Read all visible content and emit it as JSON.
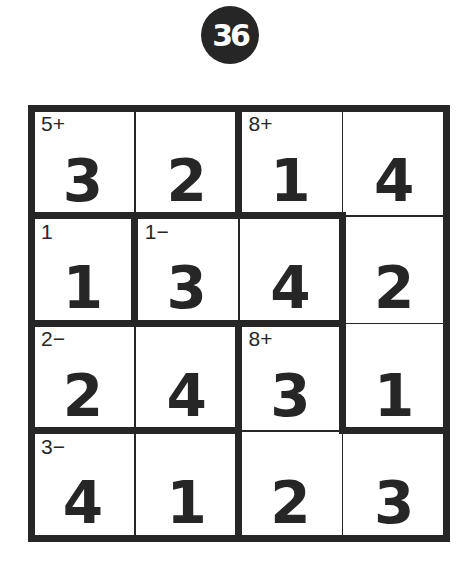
{
  "puzzle": {
    "number": "36",
    "size": 4,
    "colors": {
      "ink": "#262626",
      "background": "#ffffff"
    },
    "cells": [
      [
        {
          "value": "3",
          "clue": "5+"
        },
        {
          "value": "2",
          "clue": ""
        },
        {
          "value": "1",
          "clue": "8+"
        },
        {
          "value": "4",
          "clue": ""
        }
      ],
      [
        {
          "value": "1",
          "clue": "1"
        },
        {
          "value": "3",
          "clue": "1−"
        },
        {
          "value": "4",
          "clue": ""
        },
        {
          "value": "2",
          "clue": ""
        }
      ],
      [
        {
          "value": "2",
          "clue": "2−"
        },
        {
          "value": "4",
          "clue": ""
        },
        {
          "value": "3",
          "clue": "8+"
        },
        {
          "value": "1",
          "clue": ""
        }
      ],
      [
        {
          "value": "4",
          "clue": "3−"
        },
        {
          "value": "1",
          "clue": ""
        },
        {
          "value": "2",
          "clue": ""
        },
        {
          "value": "3",
          "clue": ""
        }
      ]
    ],
    "cages": [
      {
        "clue": "5+",
        "cells": [
          [
            0,
            0
          ],
          [
            0,
            1
          ]
        ]
      },
      {
        "clue": "8+",
        "cells": [
          [
            0,
            2
          ],
          [
            0,
            3
          ],
          [
            1,
            3
          ],
          [
            2,
            3
          ]
        ]
      },
      {
        "clue": "1",
        "cells": [
          [
            1,
            0
          ]
        ]
      },
      {
        "clue": "1−",
        "cells": [
          [
            1,
            1
          ],
          [
            1,
            2
          ]
        ]
      },
      {
        "clue": "2−",
        "cells": [
          [
            2,
            0
          ],
          [
            2,
            1
          ]
        ]
      },
      {
        "clue": "8+",
        "cells": [
          [
            2,
            2
          ],
          [
            3,
            2
          ],
          [
            3,
            3
          ]
        ]
      },
      {
        "clue": "3−",
        "cells": [
          [
            3,
            0
          ],
          [
            3,
            1
          ]
        ]
      }
    ]
  }
}
